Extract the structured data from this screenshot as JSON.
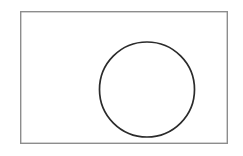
{
  "canvas": {
    "width": 243,
    "height": 156,
    "background_color": "#ffffff",
    "title": "Rectangle with inscribed circle"
  },
  "shapes": {
    "frame_rect": {
      "name": "rectangle",
      "x": 20,
      "y": 11,
      "width": 208,
      "height": 133,
      "stroke_color": "#8d8d8d",
      "stroke_width": 1.4,
      "fill_color": "none"
    },
    "circle": {
      "name": "circle",
      "cx": 147,
      "cy": 89.5,
      "r": 47.5,
      "stroke_color": "#2b2b2b",
      "stroke_width": 1.7,
      "fill_color": "none"
    }
  }
}
